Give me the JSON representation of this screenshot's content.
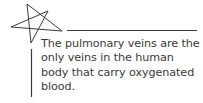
{
  "card": {
    "icon": "star-outline-icon",
    "text": "The pulmonary veins are the only veins in the human body that carry oxygenated blood.",
    "colors": {
      "ink": "#3a3a3a",
      "background": "#ffffff"
    }
  }
}
